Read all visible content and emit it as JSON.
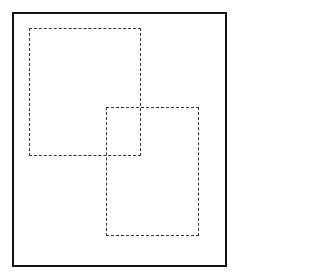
{
  "diagram": {
    "frame": {
      "border_color": "#111111",
      "background": "#ffffff"
    },
    "shapes": [
      {
        "id": "rect1",
        "type": "dashed-rectangle",
        "label": ""
      },
      {
        "id": "rect2",
        "type": "dashed-rectangle",
        "label": ""
      }
    ],
    "colors": {
      "dash": "#333333"
    }
  }
}
